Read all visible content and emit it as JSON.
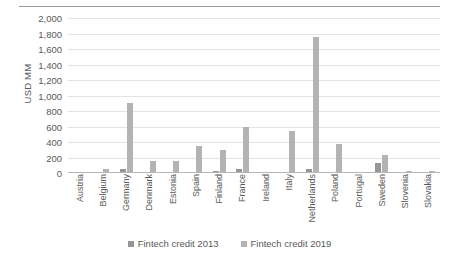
{
  "chart_data": {
    "type": "bar",
    "title": "",
    "subtitle": "",
    "xlabel": "",
    "ylabel": "USD MM",
    "ylim": [
      0,
      2000
    ],
    "ytick_step": 200,
    "yticks": [
      "0",
      "200",
      "400",
      "600",
      "800",
      "1,000",
      "1,200",
      "1,400",
      "1,600",
      "1,800",
      "2,000"
    ],
    "grid": true,
    "grid_axis": "y",
    "legend_position": "bottom-center",
    "categories": [
      "Austria",
      "Belgium",
      "Germany",
      "Denmark",
      "Estonia",
      "Spain",
      "Finland",
      "France",
      "Ireland",
      "Italy",
      "Netherlands",
      "Poland",
      "Portugal",
      "Sweden",
      "Slovenia",
      "Slovakia"
    ],
    "series": [
      {
        "name": "Fintech credit 2013",
        "color": "#969696",
        "values": [
          3,
          2,
          50,
          2,
          2,
          5,
          25,
          55,
          2,
          5,
          55,
          4,
          2,
          130,
          2,
          2
        ]
      },
      {
        "name": "Fintech credit 2019",
        "color": "#b3b3b3",
        "values": [
          5,
          55,
          900,
          150,
          160,
          350,
          300,
          600,
          10,
          540,
          1750,
          375,
          15,
          230,
          25,
          20
        ]
      }
    ]
  },
  "legend": {
    "items": [
      {
        "label": "Fintech credit 2013",
        "series": 0
      },
      {
        "label": "Fintech credit 2019",
        "series": 1
      }
    ]
  }
}
